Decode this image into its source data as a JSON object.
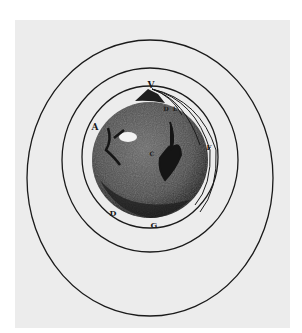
{
  "figure": {
    "colors": {
      "paper": "#ececec",
      "ink": "#1a1a1a",
      "earth": "#555555",
      "earth_dark": "#2a2a2a",
      "highlight": "#f2f2f2"
    },
    "labels": {
      "top": "V",
      "left": "A",
      "lower_left": "D",
      "bottom": "G",
      "right": "F",
      "near_top_1": "D",
      "near_top_2": "E",
      "center": "C"
    },
    "trajectory_count": 4,
    "orbit_count": 3
  }
}
